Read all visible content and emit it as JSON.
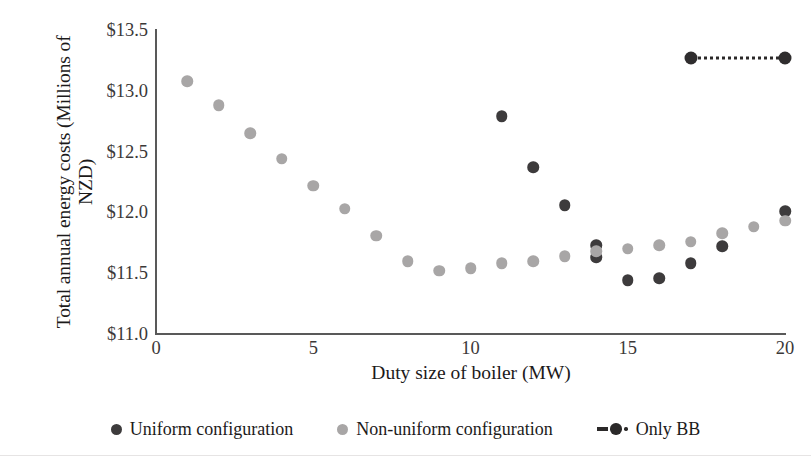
{
  "chart_data": {
    "type": "scatter",
    "title": "",
    "xlabel": "Duty size of boiler (MW)",
    "ylabel": "Total annual energy costs (Millions of NZD)",
    "xlim": [
      0,
      20
    ],
    "ylim": [
      11.0,
      13.5
    ],
    "xticks": [
      "0",
      "5",
      "10",
      "15",
      "20"
    ],
    "xtick_values": [
      0,
      5,
      10,
      15,
      20
    ],
    "yticks": [
      "$11.0",
      "$11.5",
      "$12.0",
      "$12.5",
      "$13.0",
      "$13.5"
    ],
    "ytick_values": [
      11.0,
      11.5,
      12.0,
      12.5,
      13.0,
      13.5
    ],
    "grid": false,
    "legend_position": "bottom",
    "series": [
      {
        "name": "Uniform configuration",
        "marker": "circle",
        "color": "#3d3b3c",
        "points": [
          {
            "x": 11,
            "y": 12.79
          },
          {
            "x": 12,
            "y": 12.37
          },
          {
            "x": 13,
            "y": 12.06
          },
          {
            "x": 14,
            "y": 11.73
          },
          {
            "x": 14,
            "y": 11.63
          },
          {
            "x": 15,
            "y": 11.44
          },
          {
            "x": 16,
            "y": 11.46
          },
          {
            "x": 17,
            "y": 11.58
          },
          {
            "x": 18,
            "y": 11.72
          },
          {
            "x": 20,
            "y": 12.01
          }
        ]
      },
      {
        "name": "Non-uniform configuration",
        "marker": "circle",
        "color": "#a8a6a6",
        "points": [
          {
            "x": 1,
            "y": 13.08
          },
          {
            "x": 2,
            "y": 12.88
          },
          {
            "x": 3,
            "y": 12.65
          },
          {
            "x": 4,
            "y": 12.44
          },
          {
            "x": 5,
            "y": 12.22
          },
          {
            "x": 6,
            "y": 12.03
          },
          {
            "x": 7,
            "y": 11.81
          },
          {
            "x": 8,
            "y": 11.6
          },
          {
            "x": 9,
            "y": 11.52
          },
          {
            "x": 10,
            "y": 11.54
          },
          {
            "x": 11,
            "y": 11.58
          },
          {
            "x": 12,
            "y": 11.6
          },
          {
            "x": 13,
            "y": 11.64
          },
          {
            "x": 14,
            "y": 11.68
          },
          {
            "x": 15,
            "y": 11.7
          },
          {
            "x": 16,
            "y": 11.73
          },
          {
            "x": 17,
            "y": 11.76
          },
          {
            "x": 18,
            "y": 11.83
          },
          {
            "x": 19,
            "y": 11.88
          },
          {
            "x": 20,
            "y": 11.93
          }
        ]
      },
      {
        "name": "Only BB",
        "marker": "circle-dotted-line",
        "color": "#2b2929",
        "points": [
          {
            "x": 17,
            "y": 13.27
          },
          {
            "x": 20,
            "y": 13.27
          }
        ]
      }
    ]
  },
  "legend": {
    "items": [
      {
        "label": "Uniform configuration",
        "style": "uniform"
      },
      {
        "label": "Non-uniform configuration",
        "style": "nonuni"
      },
      {
        "label": "Only BB",
        "style": "bb"
      }
    ]
  }
}
